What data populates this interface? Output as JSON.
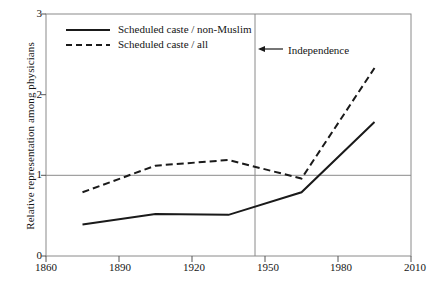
{
  "chart_data": {
    "type": "line",
    "title": "",
    "xlabel": "",
    "ylabel": "Relative representation among physicians",
    "xlim": [
      1860,
      2010
    ],
    "ylim": [
      0,
      3
    ],
    "xticks": [
      1860,
      1890,
      1920,
      1950,
      1980,
      2010
    ],
    "yticks": [
      0,
      1,
      2,
      3
    ],
    "grid": "horizontal reference line at y=1 only",
    "legend_position": "top-left inside axes",
    "annotations": [
      {
        "text": "Independence",
        "arrow": "←",
        "x": 1947,
        "y": 2.6,
        "points_to": "vertical line at 1947"
      }
    ],
    "reference_lines": [
      {
        "orientation": "vertical",
        "value": 1947,
        "label": "Independence"
      },
      {
        "orientation": "horizontal",
        "value": 1
      }
    ],
    "series": [
      {
        "name": "Scheduled caste / non-Muslim",
        "style": "solid",
        "color": "#1a1a1a",
        "x": [
          1875,
          1905,
          1935,
          1965,
          1995
        ],
        "values": [
          0.39,
          0.52,
          0.51,
          0.79,
          1.66
        ]
      },
      {
        "name": "Scheduled caste / all",
        "style": "dashed",
        "color": "#1a1a1a",
        "x": [
          1875,
          1905,
          1935,
          1965,
          1995
        ],
        "values": [
          0.79,
          1.12,
          1.19,
          0.96,
          2.33
        ]
      }
    ]
  },
  "legend": {
    "items": [
      {
        "label": "Scheduled caste / non-Muslim",
        "style": "solid"
      },
      {
        "label": "Scheduled caste / all",
        "style": "dashed"
      }
    ]
  },
  "axes": {
    "y_title": "Relative representation among physicians",
    "y_tick_labels": [
      "0",
      "1",
      "2",
      "3"
    ],
    "x_tick_labels": [
      "1860",
      "1890",
      "1920",
      "1950",
      "1980",
      "2010"
    ]
  },
  "annotation": {
    "arrow_glyph": "←",
    "text": "Independence"
  },
  "colors": {
    "line": "#1a1a1a",
    "frame": "#8a8a8a",
    "reference": "#8a8a8a",
    "background": "#ffffff"
  }
}
